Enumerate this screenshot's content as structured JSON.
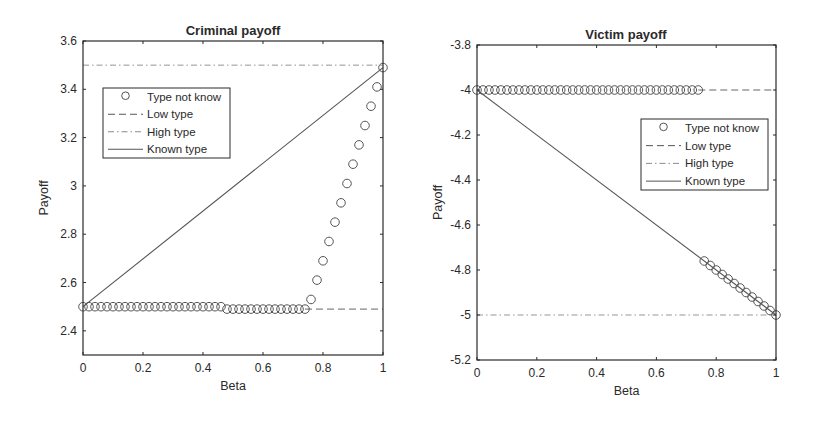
{
  "chart_data": [
    {
      "type": "line",
      "title": "Criminal payoff",
      "xlabel": "Beta",
      "ylabel": "Payoff",
      "xlim": [
        0,
        1
      ],
      "ylim": [
        2.3,
        3.6
      ],
      "xticks": [
        0,
        0.2,
        0.4,
        0.6,
        0.8,
        1
      ],
      "xtick_labels": [
        "0",
        "0.2",
        "0.4",
        "0.6",
        "0.8",
        "1"
      ],
      "yticks": [
        2.4,
        2.6,
        2.8,
        3.0,
        3.2,
        3.4,
        3.6
      ],
      "ytick_labels": [
        "2.4",
        "2.6",
        "2.8",
        "3",
        "3.2",
        "3.4",
        "3.6"
      ],
      "grid": false,
      "legend_position": "upper-left",
      "legend": [
        "Type not know",
        "Low type",
        "High type",
        "Known type"
      ],
      "series": [
        {
          "name": "Type not know",
          "style": "circle-markers",
          "x": [
            0,
            0.02,
            0.04,
            0.06,
            0.08,
            0.1,
            0.12,
            0.14,
            0.16,
            0.18,
            0.2,
            0.22,
            0.24,
            0.26,
            0.28,
            0.3,
            0.32,
            0.34,
            0.36,
            0.38,
            0.4,
            0.42,
            0.44,
            0.46,
            0.48,
            0.5,
            0.52,
            0.54,
            0.56,
            0.58,
            0.6,
            0.62,
            0.64,
            0.66,
            0.68,
            0.7,
            0.72,
            0.74,
            0.76,
            0.78,
            0.8,
            0.82,
            0.84,
            0.86,
            0.88,
            0.9,
            0.92,
            0.94,
            0.96,
            0.98,
            1.0
          ],
          "y": [
            2.5,
            2.5,
            2.5,
            2.5,
            2.5,
            2.5,
            2.5,
            2.5,
            2.5,
            2.5,
            2.5,
            2.5,
            2.5,
            2.5,
            2.5,
            2.5,
            2.5,
            2.5,
            2.5,
            2.5,
            2.5,
            2.5,
            2.5,
            2.5,
            2.49,
            2.49,
            2.49,
            2.49,
            2.49,
            2.49,
            2.49,
            2.49,
            2.49,
            2.49,
            2.49,
            2.49,
            2.49,
            2.49,
            2.53,
            2.61,
            2.69,
            2.77,
            2.85,
            2.93,
            3.01,
            3.09,
            3.17,
            3.25,
            3.33,
            3.41,
            3.49
          ]
        },
        {
          "name": "Low type",
          "style": "dashed",
          "x": [
            0.74,
            1.0
          ],
          "y": [
            2.49,
            2.49
          ]
        },
        {
          "name": "High type",
          "style": "dash-dot",
          "x": [
            0,
            1.0
          ],
          "y": [
            3.5,
            3.5
          ]
        },
        {
          "name": "Known type",
          "style": "solid",
          "x": [
            0,
            1.0
          ],
          "y": [
            2.5,
            3.49
          ]
        }
      ]
    },
    {
      "type": "line",
      "title": "Victim payoff",
      "xlabel": "Beta",
      "ylabel": "Payoff",
      "xlim": [
        0,
        1
      ],
      "ylim": [
        -5.2,
        -3.8
      ],
      "xticks": [
        0,
        0.2,
        0.4,
        0.6,
        0.8,
        1
      ],
      "xtick_labels": [
        "0",
        "0.2",
        "0.4",
        "0.6",
        "0.8",
        "1"
      ],
      "yticks": [
        -5.2,
        -5.0,
        -4.8,
        -4.6,
        -4.4,
        -4.2,
        -4.0,
        -3.8
      ],
      "ytick_labels": [
        "-5.2",
        "-5",
        "-4.8",
        "-4.6",
        "-4.4",
        "-4.2",
        "-4",
        "-3.8"
      ],
      "grid": false,
      "legend_position": "upper-right",
      "legend": [
        "Type not know",
        "Low type",
        "High type",
        "Known type"
      ],
      "series": [
        {
          "name": "Type not know",
          "style": "circle-markers",
          "x": [
            0,
            0.02,
            0.04,
            0.06,
            0.08,
            0.1,
            0.12,
            0.14,
            0.16,
            0.18,
            0.2,
            0.22,
            0.24,
            0.26,
            0.28,
            0.3,
            0.32,
            0.34,
            0.36,
            0.38,
            0.4,
            0.42,
            0.44,
            0.46,
            0.48,
            0.5,
            0.52,
            0.54,
            0.56,
            0.58,
            0.6,
            0.62,
            0.64,
            0.66,
            0.68,
            0.7,
            0.72,
            0.74,
            0.76,
            0.78,
            0.8,
            0.82,
            0.84,
            0.86,
            0.88,
            0.9,
            0.92,
            0.94,
            0.96,
            0.98,
            1.0
          ],
          "y": [
            -4.0,
            -4.0,
            -4.0,
            -4.0,
            -4.0,
            -4.0,
            -4.0,
            -4.0,
            -4.0,
            -4.0,
            -4.0,
            -4.0,
            -4.0,
            -4.0,
            -4.0,
            -4.0,
            -4.0,
            -4.0,
            -4.0,
            -4.0,
            -4.0,
            -4.0,
            -4.0,
            -4.0,
            -4.0,
            -4.0,
            -4.0,
            -4.0,
            -4.0,
            -4.0,
            -4.0,
            -4.0,
            -4.0,
            -4.0,
            -4.0,
            -4.0,
            -4.0,
            -4.0,
            -4.76,
            -4.78,
            -4.8,
            -4.82,
            -4.84,
            -4.86,
            -4.88,
            -4.9,
            -4.92,
            -4.94,
            -4.96,
            -4.98,
            -5.0
          ]
        },
        {
          "name": "Low type",
          "style": "dashed",
          "x": [
            0.74,
            1.0
          ],
          "y": [
            -4.0,
            -4.0
          ]
        },
        {
          "name": "High type",
          "style": "dash-dot",
          "x": [
            0,
            1.0
          ],
          "y": [
            -5.0,
            -5.0
          ]
        },
        {
          "name": "Known type",
          "style": "solid",
          "x": [
            0,
            1.0
          ],
          "y": [
            -4.0,
            -5.0
          ]
        }
      ]
    }
  ],
  "layout": {
    "plots": [
      {
        "left": 83,
        "top": 41,
        "right": 383,
        "bottom": 355,
        "legend": {
          "x": 103,
          "y": 88,
          "w": 127,
          "h": 70
        },
        "title_x": 233,
        "title_y": 35
      },
      {
        "left": 477,
        "top": 45,
        "right": 776,
        "bottom": 360,
        "legend": {
          "x": 641,
          "y": 119,
          "w": 127,
          "h": 71
        },
        "title_x": 626,
        "title_y": 39
      }
    ],
    "colors": {
      "axis": "#2b2b2b",
      "line": "#555555",
      "marker": "#555555",
      "high": "#8a8a8a"
    }
  }
}
